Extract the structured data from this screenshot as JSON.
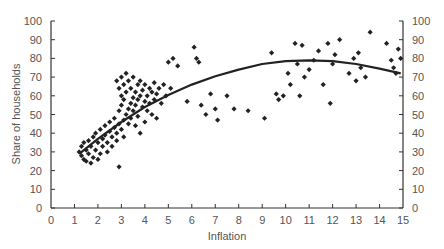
{
  "chart_data": {
    "type": "scatter",
    "title": "",
    "xlabel": "Inflation",
    "ylabel": "Share of households",
    "xlim": [
      0,
      15
    ],
    "ylim": [
      0,
      100
    ],
    "x_ticks": [
      0,
      1,
      2,
      3,
      4,
      5,
      6,
      7,
      8,
      9,
      10,
      11,
      12,
      13,
      14,
      15
    ],
    "y_ticks": [
      0,
      10,
      20,
      30,
      40,
      50,
      60,
      70,
      80,
      90,
      100
    ],
    "right_y_axis": true,
    "grid": false,
    "legend": null,
    "marker_color": "#222222",
    "trend_line": {
      "type": "quadratic",
      "color": "#222222",
      "x": [
        1.2,
        2,
        3,
        4,
        5,
        6,
        7,
        8,
        9,
        10,
        11,
        12,
        13,
        14,
        14.9
      ],
      "y": [
        29,
        37,
        46,
        54,
        60.5,
        66,
        70.5,
        74,
        77,
        78.5,
        79,
        78.5,
        77,
        74.5,
        72
      ]
    },
    "series": [
      {
        "name": "observations",
        "points": [
          [
            1.2,
            30
          ],
          [
            1.3,
            28
          ],
          [
            1.3,
            33
          ],
          [
            1.4,
            26
          ],
          [
            1.4,
            35
          ],
          [
            1.5,
            31
          ],
          [
            1.5,
            25
          ],
          [
            1.6,
            29
          ],
          [
            1.6,
            36
          ],
          [
            1.7,
            24
          ],
          [
            1.7,
            33
          ],
          [
            1.8,
            38
          ],
          [
            1.8,
            27
          ],
          [
            1.9,
            31
          ],
          [
            1.9,
            40
          ],
          [
            2.0,
            35
          ],
          [
            2.0,
            26
          ],
          [
            2.1,
            29
          ],
          [
            2.1,
            42
          ],
          [
            2.2,
            37
          ],
          [
            2.2,
            33
          ],
          [
            2.3,
            44
          ],
          [
            2.3,
            39
          ],
          [
            2.4,
            35
          ],
          [
            2.4,
            30
          ],
          [
            2.5,
            41
          ],
          [
            2.5,
            46
          ],
          [
            2.6,
            38
          ],
          [
            2.6,
            33
          ],
          [
            2.7,
            43
          ],
          [
            2.7,
            48
          ],
          [
            2.8,
            40
          ],
          [
            2.8,
            36
          ],
          [
            2.8,
            68
          ],
          [
            2.9,
            45
          ],
          [
            2.9,
            52
          ],
          [
            2.9,
            64
          ],
          [
            2.9,
            22
          ],
          [
            3.0,
            42
          ],
          [
            3.0,
            55
          ],
          [
            3.0,
            70
          ],
          [
            3.0,
            60
          ],
          [
            3.1,
            47
          ],
          [
            3.1,
            58
          ],
          [
            3.1,
            66
          ],
          [
            3.1,
            38
          ],
          [
            3.2,
            50
          ],
          [
            3.2,
            72
          ],
          [
            3.2,
            62
          ],
          [
            3.3,
            53
          ],
          [
            3.3,
            45
          ],
          [
            3.3,
            68
          ],
          [
            3.4,
            56
          ],
          [
            3.4,
            64
          ],
          [
            3.4,
            48
          ],
          [
            3.5,
            59
          ],
          [
            3.5,
            70
          ],
          [
            3.5,
            52
          ],
          [
            3.6,
            62
          ],
          [
            3.6,
            55
          ],
          [
            3.6,
            44
          ],
          [
            3.7,
            66
          ],
          [
            3.7,
            58
          ],
          [
            3.7,
            49
          ],
          [
            3.8,
            60
          ],
          [
            3.8,
            68
          ],
          [
            3.8,
            40
          ],
          [
            3.9,
            54
          ],
          [
            3.9,
            63
          ],
          [
            4.0,
            57
          ],
          [
            4.0,
            46
          ],
          [
            4.0,
            66
          ],
          [
            4.1,
            60
          ],
          [
            4.1,
            52
          ],
          [
            4.2,
            64
          ],
          [
            4.2,
            56
          ],
          [
            4.3,
            62
          ],
          [
            4.3,
            50
          ],
          [
            4.4,
            67
          ],
          [
            4.4,
            58
          ],
          [
            4.5,
            61
          ],
          [
            4.5,
            48
          ],
          [
            4.6,
            64
          ],
          [
            4.7,
            56
          ],
          [
            4.8,
            66
          ],
          [
            4.9,
            60
          ],
          [
            5.0,
            78
          ],
          [
            5.1,
            64
          ],
          [
            5.2,
            80
          ],
          [
            5.4,
            76
          ],
          [
            5.8,
            57
          ],
          [
            6.1,
            86
          ],
          [
            6.2,
            80
          ],
          [
            6.3,
            78
          ],
          [
            6.4,
            55
          ],
          [
            6.6,
            50
          ],
          [
            6.8,
            61
          ],
          [
            7.0,
            53
          ],
          [
            7.1,
            47
          ],
          [
            7.5,
            60
          ],
          [
            7.8,
            53
          ],
          [
            8.4,
            52
          ],
          [
            9.1,
            48
          ],
          [
            9.4,
            83
          ],
          [
            9.6,
            61
          ],
          [
            9.7,
            58
          ],
          [
            9.9,
            60
          ],
          [
            10.1,
            72
          ],
          [
            10.2,
            66
          ],
          [
            10.4,
            88
          ],
          [
            10.5,
            77
          ],
          [
            10.6,
            60
          ],
          [
            10.7,
            87
          ],
          [
            10.8,
            70
          ],
          [
            11.0,
            74
          ],
          [
            11.2,
            79
          ],
          [
            11.4,
            84
          ],
          [
            11.6,
            66
          ],
          [
            11.8,
            88
          ],
          [
            11.9,
            56
          ],
          [
            12.0,
            77
          ],
          [
            12.1,
            82
          ],
          [
            12.3,
            90
          ],
          [
            12.7,
            72
          ],
          [
            12.9,
            80
          ],
          [
            13.0,
            68
          ],
          [
            13.1,
            83
          ],
          [
            13.2,
            75
          ],
          [
            13.4,
            70
          ],
          [
            13.6,
            94
          ],
          [
            14.3,
            88
          ],
          [
            14.5,
            79
          ],
          [
            14.6,
            75
          ],
          [
            14.7,
            72
          ],
          [
            14.8,
            85
          ],
          [
            14.9,
            80
          ]
        ]
      }
    ]
  }
}
